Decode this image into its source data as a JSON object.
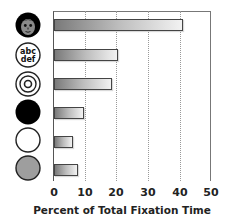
{
  "chart_data": {
    "type": "bar",
    "orientation": "horizontal",
    "title": "",
    "xlabel": "Percent of Total Fixation Time",
    "ylabel": "",
    "xlim": [
      0,
      50
    ],
    "x_ticks": [
      "0",
      "10",
      "20",
      "30",
      "40",
      "50"
    ],
    "grid": "vertical dotted",
    "legend": "none",
    "categories": [
      "face",
      "text (abc def)",
      "concentric circles",
      "black disk",
      "white disk",
      "gray disk"
    ],
    "category_icons": [
      "face-icon",
      "text-abc-def-icon",
      "concentric-circles-icon",
      "black-disk-icon",
      "white-disk-icon",
      "gray-disk-icon"
    ],
    "values": [
      41,
      20.5,
      18.5,
      9.5,
      6,
      7.5
    ]
  },
  "icon_text": {
    "line1": "abc",
    "line2": "def"
  },
  "colors": {
    "bar_dark": "#7a7a7a",
    "bar_light": "#f2f2f2",
    "gray_disk": "#9e9e9e",
    "axis": "#555555"
  }
}
